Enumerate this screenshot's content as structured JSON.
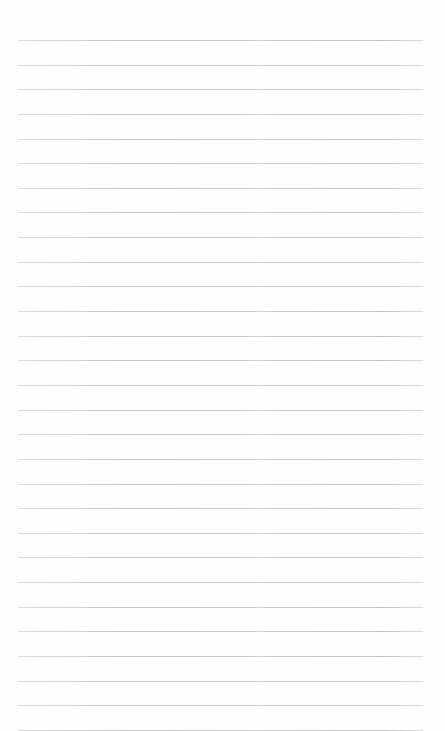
{
  "page": {
    "type": "lined-paper",
    "background_color": "#fefefe",
    "line_color": "#c8c8c8",
    "line_count": 29,
    "first_line_y": 40,
    "line_spacing": 24.64,
    "line_left": 18,
    "line_width": 405
  }
}
